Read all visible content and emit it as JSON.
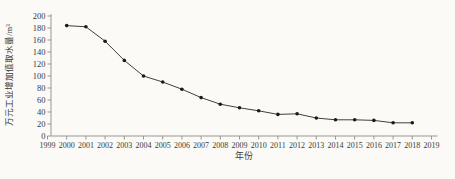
{
  "page": {
    "background": "#fbfaf7"
  },
  "chart_data": {
    "type": "line",
    "title": "",
    "xlabel": "年份",
    "ylabel": "万元工业增加值取水量/m³",
    "x": [
      2000,
      2001,
      2002,
      2003,
      2004,
      2005,
      2006,
      2007,
      2008,
      2009,
      2010,
      2011,
      2012,
      2013,
      2014,
      2015,
      2016,
      2017,
      2018
    ],
    "values": [
      184,
      182,
      158,
      126,
      100,
      90,
      78,
      64,
      53,
      47,
      42,
      36,
      37,
      30,
      27,
      27,
      26,
      22,
      22
    ],
    "x_ticks": [
      1999,
      2000,
      2001,
      2002,
      2003,
      2004,
      2005,
      2006,
      2007,
      2008,
      2009,
      2010,
      2011,
      2012,
      2013,
      2014,
      2015,
      2016,
      2017,
      2018,
      2019
    ],
    "y_ticks": [
      0,
      20,
      40,
      60,
      80,
      100,
      120,
      140,
      160,
      180,
      200
    ],
    "xlim": [
      1999,
      2019
    ],
    "ylim": [
      0,
      200
    ],
    "grid": false,
    "legend_position": "none",
    "marker": "filled-dot",
    "colors": {
      "line": "#3f3f3f",
      "marker": "#1a1a1a",
      "axis": "#999790",
      "tick_text": "#3a3a38",
      "label_text": "#3a3a38"
    }
  }
}
